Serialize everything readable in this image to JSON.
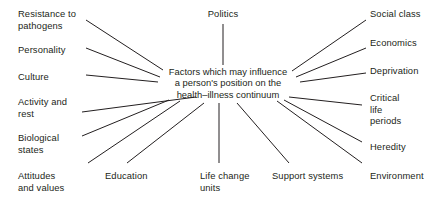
{
  "diagram": {
    "center": {
      "line1": "Factors which may influence",
      "line2": "a person's position on the",
      "line3": "health–illness continuum"
    },
    "line_color": "#231f20",
    "text_color": "#231f20",
    "background": "#ffffff",
    "nodes": [
      {
        "id": "resistance-to-pathogens",
        "label": "Resistance to\npathogens",
        "x": 18,
        "y": 8,
        "align": "left",
        "width": 78
      },
      {
        "id": "personality",
        "label": "Personality",
        "x": 18,
        "y": 44,
        "align": "left",
        "width": 78
      },
      {
        "id": "culture",
        "label": "Culture",
        "x": 18,
        "y": 71,
        "align": "left",
        "width": 78
      },
      {
        "id": "activity-and-rest",
        "label": "Activity and\nrest",
        "x": 18,
        "y": 96,
        "align": "left",
        "width": 78
      },
      {
        "id": "biological-states",
        "label": "Biological\nstates",
        "x": 18,
        "y": 132,
        "align": "left",
        "width": 78
      },
      {
        "id": "attitudes-and-values",
        "label": "Attitudes\nand values",
        "x": 18,
        "y": 170,
        "align": "left",
        "width": 78
      },
      {
        "id": "politics",
        "label": "Politics",
        "x": 188,
        "y": 8,
        "align": "center",
        "width": 70
      },
      {
        "id": "social-class",
        "label": "Social class",
        "x": 370,
        "y": 8,
        "align": "left",
        "width": 74
      },
      {
        "id": "economics",
        "label": "Economics",
        "x": 370,
        "y": 37,
        "align": "left",
        "width": 74
      },
      {
        "id": "deprivation",
        "label": "Deprivation",
        "x": 370,
        "y": 65,
        "align": "left",
        "width": 74
      },
      {
        "id": "critical-life-periods",
        "label": "Critical\nlife\nperiods",
        "x": 370,
        "y": 92,
        "align": "left",
        "width": 74
      },
      {
        "id": "heredity",
        "label": "Heredity",
        "x": 370,
        "y": 141,
        "align": "left",
        "width": 74
      },
      {
        "id": "environment",
        "label": "Environment",
        "x": 370,
        "y": 170,
        "align": "left",
        "width": 74
      },
      {
        "id": "education",
        "label": "Education",
        "x": 105,
        "y": 170,
        "align": "left",
        "width": 70
      },
      {
        "id": "life-change-units",
        "label": "Life change\nunits",
        "x": 200,
        "y": 170,
        "align": "left",
        "width": 64
      },
      {
        "id": "support-systems",
        "label": "Support systems",
        "x": 272,
        "y": 170,
        "align": "left",
        "width": 86
      }
    ],
    "connectors": [
      {
        "id": "connector-resistance-to-pathogens",
        "x1": 86,
        "y1": 20,
        "x2": 163,
        "y2": 70
      },
      {
        "id": "connector-personality",
        "x1": 86,
        "y1": 48,
        "x2": 160,
        "y2": 77
      },
      {
        "id": "connector-culture",
        "x1": 86,
        "y1": 75,
        "x2": 158,
        "y2": 82
      },
      {
        "id": "connector-activity-and-rest",
        "x1": 82,
        "y1": 112,
        "x2": 196,
        "y2": 97
      },
      {
        "id": "connector-biological-states",
        "x1": 82,
        "y1": 136,
        "x2": 169,
        "y2": 100
      },
      {
        "id": "connector-attitudes-and-values",
        "x1": 88,
        "y1": 163,
        "x2": 180,
        "y2": 101
      },
      {
        "id": "connector-politics",
        "x1": 223,
        "y1": 24,
        "x2": 223,
        "y2": 65
      },
      {
        "id": "connector-social-class",
        "x1": 366,
        "y1": 20,
        "x2": 292,
        "y2": 71
      },
      {
        "id": "connector-economics",
        "x1": 366,
        "y1": 48,
        "x2": 296,
        "y2": 77
      },
      {
        "id": "connector-deprivation",
        "x1": 366,
        "y1": 73,
        "x2": 300,
        "y2": 82
      },
      {
        "id": "connector-critical-life-periods",
        "x1": 362,
        "y1": 105,
        "x2": 289,
        "y2": 97
      },
      {
        "id": "connector-heredity",
        "x1": 362,
        "y1": 142,
        "x2": 284,
        "y2": 100
      },
      {
        "id": "connector-environment",
        "x1": 362,
        "y1": 163,
        "x2": 277,
        "y2": 101
      },
      {
        "id": "connector-education",
        "x1": 127,
        "y1": 163,
        "x2": 204,
        "y2": 103
      },
      {
        "id": "connector-life-change-units",
        "x1": 219,
        "y1": 163,
        "x2": 219,
        "y2": 103
      },
      {
        "id": "connector-support-systems",
        "x1": 289,
        "y1": 163,
        "x2": 237,
        "y2": 103
      }
    ]
  }
}
